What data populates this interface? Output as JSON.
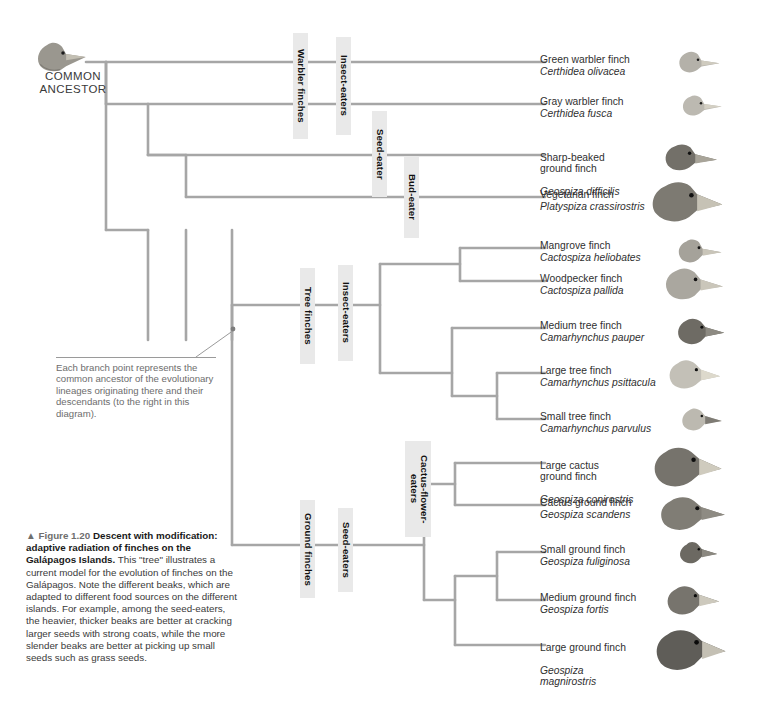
{
  "figure": {
    "root_label_line1": "COMMON",
    "root_label_line2": "ANCESTOR",
    "caption_triangle": "▲",
    "caption_fignum": "Figure 1.20",
    "caption_headline": "Descent with modification: adaptive radiation of finches on the Galápagos Islands.",
    "caption_body": "This \"tree\" illustrates a current model for the evolution of finches on the Galápagos. Note the different beaks, which are adapted to different food sources on the different islands. For example, among the seed-eaters, the heavier, thicker beaks are better at cracking larger seeds with strong coats, while the more slender beaks are better at picking up small seeds such as grass seeds.",
    "note_text": "Each branch point represents the common ancestor of the evolutionary lineages originating there and their descendants (to the right in this diagram)."
  },
  "clade_labels": [
    {
      "id": "warbler-finches",
      "text": "Warbler finches"
    },
    {
      "id": "insect-eaters-warbler",
      "text": "Insect-eaters"
    },
    {
      "id": "seed-eater",
      "text": "Seed-eater"
    },
    {
      "id": "bud-eater",
      "text": "Bud-eater"
    },
    {
      "id": "tree-finches",
      "text": "Tree finches"
    },
    {
      "id": "insect-eaters-tree",
      "text": "Insect-eaters"
    },
    {
      "id": "cactus-flower-eaters",
      "text": "Cactus-flower-\neaters"
    },
    {
      "id": "ground-finches",
      "text": "Ground finches"
    },
    {
      "id": "seed-eaters",
      "text": "Seed-eaters"
    }
  ],
  "species": [
    {
      "common": "Green warbler finch",
      "sci": "Certhidea olivacea"
    },
    {
      "common": "Gray warbler finch",
      "sci": "Certhidea fusca"
    },
    {
      "common": "Sharp-beaked\nground finch",
      "sci": "Geospiza difficilis"
    },
    {
      "common": "Vegetarian finch",
      "sci": "Platyspiza crassirostris"
    },
    {
      "common": "Mangrove finch",
      "sci": "Cactospiza heliobates"
    },
    {
      "common": "Woodpecker finch",
      "sci": "Cactospiza pallida"
    },
    {
      "common": "Medium tree finch",
      "sci": "Camarhynchus pauper"
    },
    {
      "common": "Large tree finch",
      "sci": "Camarhynchus psittacula"
    },
    {
      "common": "Small tree finch",
      "sci": "Camarhynchus parvulus"
    },
    {
      "common": "Large cactus\nground finch",
      "sci": "Geospiza conirostris"
    },
    {
      "common": "Cactus ground finch",
      "sci": "Geospiza scandens"
    },
    {
      "common": "Small ground finch",
      "sci": "Geospiza fuliginosa"
    },
    {
      "common": "Medium ground finch",
      "sci": "Geospiza fortis"
    },
    {
      "common": "Large ground finch",
      "sci": "Geospiza\nmagnirostris"
    }
  ],
  "colors": {
    "branch": "#a6a6a6",
    "label_bg": "#e9e9e9",
    "note_text": "#6d6d6d",
    "caption_fignum": "#6e6e6e",
    "text": "#303030",
    "bird_light": "#b9b6ae",
    "bird_mid": "#8e8b84",
    "bird_dark": "#5d5b57",
    "bird_beak": "#d6d2c6",
    "background": "#ffffff"
  }
}
